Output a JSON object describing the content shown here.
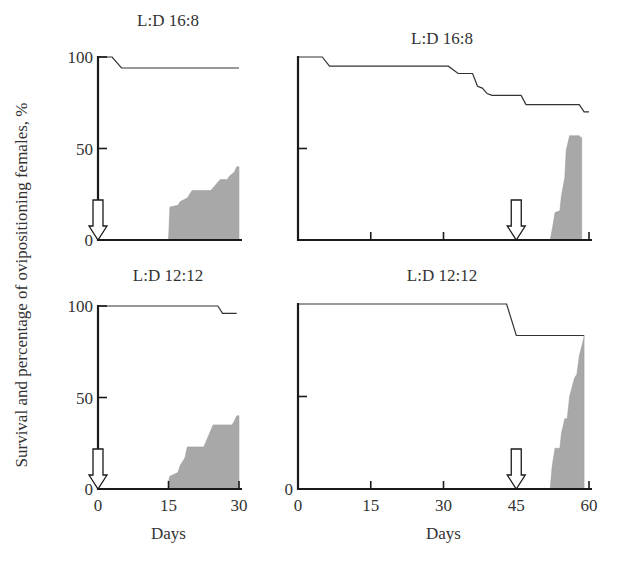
{
  "figure": {
    "ylabel": "Survival and percentage of ovipositioning females, %",
    "xlabel": "Days",
    "colors": {
      "axis": "#1a1a1a",
      "survival": "#333333",
      "oviposition": "#a8a8a8"
    }
  },
  "chart_data": [
    {
      "type": "area",
      "panel": "top-left",
      "title": "L:D 16:8",
      "xlabel": "",
      "ylabel": "Survival and percentage of ovipositioning females, %",
      "xlim": [
        0,
        30
      ],
      "ylim": [
        0,
        100
      ],
      "xticks": [],
      "yticks": [
        0,
        50,
        100
      ],
      "ytick_labels": [
        "0",
        "50",
        "100"
      ],
      "arrow_day": 0,
      "series": [
        {
          "name": "survival",
          "style": "line",
          "x": [
            0,
            3,
            5,
            30
          ],
          "y": [
            100,
            100,
            94,
            94
          ]
        },
        {
          "name": "ovipositing females",
          "style": "area",
          "x": [
            15,
            15.3,
            17,
            17.5,
            19,
            20,
            24,
            25,
            26,
            27.5,
            28,
            29,
            29.5,
            30,
            30
          ],
          "y": [
            0,
            18,
            19,
            21,
            23,
            27,
            27,
            30,
            33,
            33,
            35,
            37,
            40,
            40,
            0
          ]
        }
      ]
    },
    {
      "type": "area",
      "panel": "top-right",
      "title": "L:D 16:8",
      "xlabel": "",
      "xlim": [
        0,
        60
      ],
      "ylim": [
        0,
        100
      ],
      "xticks": [
        15,
        30,
        60
      ],
      "yticks": [
        50
      ],
      "ytick_labels": [],
      "arrow_day": 45,
      "series": [
        {
          "name": "survival",
          "style": "line",
          "x": [
            0,
            5,
            6.5,
            31,
            33,
            36,
            37,
            38,
            39,
            40,
            46,
            47,
            58,
            59,
            60
          ],
          "y": [
            100,
            100,
            95,
            95,
            91,
            91,
            84,
            83,
            80,
            79,
            79,
            74,
            74,
            70,
            70
          ]
        },
        {
          "name": "ovipositing females",
          "style": "area",
          "x": [
            52,
            52.5,
            53,
            54,
            54.3,
            55,
            55.3,
            56,
            58,
            58.3,
            58.5,
            58.5
          ],
          "y": [
            0,
            7,
            15,
            16,
            24,
            34,
            49,
            57,
            57,
            56,
            56,
            0
          ]
        }
      ]
    },
    {
      "type": "area",
      "panel": "bottom-left",
      "title": "L:D 12:12",
      "xlabel": "Days",
      "xlim": [
        0,
        30
      ],
      "ylim": [
        0,
        100
      ],
      "xticks": [
        0,
        15,
        30
      ],
      "yticks": [
        0,
        50,
        100
      ],
      "xtick_labels": [
        "0",
        "15",
        "30"
      ],
      "ytick_labels": [
        "0",
        "50",
        "100"
      ],
      "arrow_day": 0,
      "series": [
        {
          "name": "survival",
          "style": "line",
          "x": [
            0,
            25.5,
            26.5,
            29.5
          ],
          "y": [
            100,
            100,
            96,
            96
          ]
        },
        {
          "name": "ovipositing females",
          "style": "area",
          "x": [
            15,
            15,
            15.3,
            17,
            17.5,
            18.5,
            19,
            22.5,
            23,
            24,
            24.5,
            28.5,
            29,
            29.5,
            30,
            30
          ],
          "y": [
            0,
            4,
            7,
            9,
            13,
            17,
            23,
            23,
            26,
            32,
            35,
            35,
            37,
            40,
            40,
            0
          ]
        }
      ]
    },
    {
      "type": "area",
      "panel": "bottom-right",
      "title": "L:D 12:12",
      "xlabel": "Days",
      "xlim": [
        0,
        60
      ],
      "ylim": [
        0,
        100
      ],
      "xticks": [
        0,
        15,
        30,
        45,
        60
      ],
      "yticks": [
        0,
        50
      ],
      "xtick_labels": [
        "0",
        "15",
        "30",
        "45",
        "60"
      ],
      "ytick_labels": [
        "0"
      ],
      "arrow_day": 45,
      "series": [
        {
          "name": "survival",
          "style": "line",
          "x": [
            0,
            43,
            45,
            59
          ],
          "y": [
            100,
            100,
            83,
            83
          ]
        },
        {
          "name": "ovipositing females",
          "style": "area",
          "x": [
            52,
            52.4,
            53,
            54,
            54.3,
            55,
            55.5,
            56,
            57,
            57.5,
            58,
            59,
            59,
            59
          ],
          "y": [
            0,
            12,
            22,
            22,
            30,
            38,
            38,
            50,
            60,
            62,
            72,
            82,
            83,
            0
          ]
        }
      ]
    }
  ]
}
